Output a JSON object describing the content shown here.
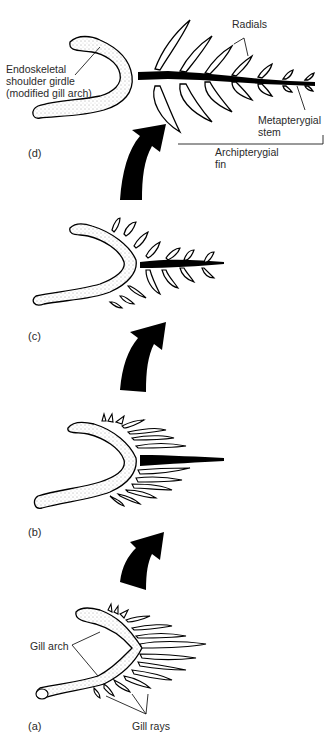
{
  "figure": {
    "stages": [
      {
        "id": "d",
        "label": "(d)"
      },
      {
        "id": "c",
        "label": "(c)"
      },
      {
        "id": "b",
        "label": "(b)"
      },
      {
        "id": "a",
        "label": "(a)"
      }
    ],
    "labels": {
      "endoskeletal": "Endoskeletal\nshoulder girdle\n(modified gill arch)",
      "radials": "Radials",
      "metapterygial": "Metapterygial\nstem",
      "archipterygial": "Archipterygial\nfin",
      "gill_arch": "Gill arch",
      "gill_rays": "Gill rays"
    },
    "colors": {
      "ink": "#000000",
      "background": "#ffffff",
      "text": "#2a2a2a"
    }
  }
}
